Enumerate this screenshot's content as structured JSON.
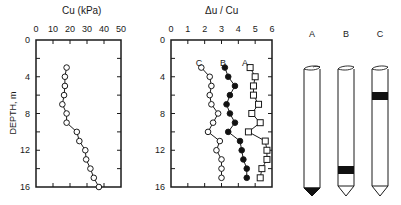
{
  "chart_data": [
    {
      "type": "line",
      "title": "Cu (kPa)",
      "xlabel": "Cu (kPa)",
      "ylabel": "DEPTH, m",
      "x_ticks": [
        "0",
        "10",
        "20",
        "30",
        "40",
        "50"
      ],
      "y_ticks": [
        "0",
        "4",
        "8",
        "12",
        "16"
      ],
      "xlim": [
        0,
        50
      ],
      "ylim": [
        0,
        16
      ],
      "y_inverted": true,
      "x_axis_position": "top",
      "grid": false,
      "series": [
        {
          "name": "Cu",
          "marker": "open-circle",
          "depth": [
            3,
            4,
            5,
            6,
            7,
            8,
            9,
            10,
            11,
            12,
            13,
            14,
            15,
            16
          ],
          "values": [
            18,
            17,
            17,
            16.5,
            15.5,
            18,
            18,
            24,
            25.5,
            29,
            29.5,
            32,
            34,
            37
          ]
        }
      ]
    },
    {
      "type": "line",
      "title": "Δu / Cu",
      "xlabel": "Δu / Cu",
      "ylabel": "",
      "x_ticks": [
        "0",
        "1",
        "2",
        "3",
        "4",
        "5",
        "6"
      ],
      "y_ticks": [
        "0",
        "4",
        "8",
        "12",
        "16"
      ],
      "xlim": [
        0,
        6
      ],
      "ylim": [
        0,
        16
      ],
      "y_inverted": true,
      "x_axis_position": "top",
      "grid": false,
      "series": [
        {
          "name": "C",
          "marker": "open-circle",
          "depth": [
            3,
            4,
            5,
            6,
            7,
            8,
            9,
            10,
            11,
            12,
            13,
            14,
            15
          ],
          "values": [
            1.8,
            2.3,
            2.4,
            2.3,
            2.4,
            2.8,
            2.5,
            2.2,
            2.9,
            2.7,
            3.0,
            3.0,
            3.0
          ]
        },
        {
          "name": "B",
          "marker": "filled-circle",
          "depth": [
            3,
            4,
            5,
            6,
            7,
            8,
            9,
            10,
            11,
            12,
            13,
            14,
            15
          ],
          "values": [
            3.2,
            3.4,
            3.8,
            3.5,
            3.3,
            3.5,
            3.8,
            3.4,
            4.1,
            4.2,
            4.3,
            4.5,
            4.5
          ]
        },
        {
          "name": "A",
          "marker": "open-square",
          "depth": [
            3,
            4,
            5,
            6,
            7,
            8,
            9,
            10,
            11,
            12,
            13,
            14,
            15
          ],
          "values": [
            4.7,
            5.0,
            4.9,
            4.9,
            5.2,
            4.8,
            5.3,
            4.6,
            5.6,
            5.7,
            5.7,
            5.4,
            5.3
          ]
        }
      ],
      "annotations": [
        "C",
        "B",
        "A"
      ]
    }
  ],
  "piles": [
    {
      "label": "A",
      "tip": "filled-cone",
      "band": "none"
    },
    {
      "label": "B",
      "tip": "open-cone",
      "band": "near-tip"
    },
    {
      "label": "C",
      "tip": "open-cone",
      "band": "upper-shaft"
    }
  ],
  "labels": {
    "chart1_title": "Cu (kPa)",
    "chart2_title": "Δu / Cu",
    "depth_axis": "DEPTH, m",
    "series_c": "C",
    "series_b": "B",
    "series_a": "A",
    "pile_a": "A",
    "pile_b": "B",
    "pile_c": "C"
  }
}
